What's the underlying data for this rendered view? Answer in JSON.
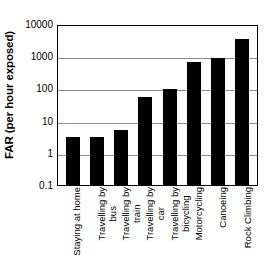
{
  "chart_data": {
    "type": "bar",
    "title": "",
    "xlabel": "",
    "ylabel": "FAR (per hour exposed)",
    "yscale": "log",
    "ylim": [
      0.1,
      10000
    ],
    "yticks": [
      "10000",
      "1000",
      "100",
      "10",
      "1",
      "0.1"
    ],
    "ytick_values": [
      10000,
      1000,
      100,
      10,
      1,
      0.1
    ],
    "grid": true,
    "legend": false,
    "categories": [
      "Staying at home",
      "Travelling by bus",
      "Travelling by train",
      "Travelling by car",
      "Travelling by bicycling",
      "Motorcycling",
      "Canoeing",
      "Rock Climbing"
    ],
    "category_lines": [
      {
        "line1": "Staying at home",
        "line2": ""
      },
      {
        "line1": "Travelling by",
        "line2": "bus"
      },
      {
        "line1": "Travelling by",
        "line2": "train"
      },
      {
        "line1": "Travelling by",
        "line2": "car"
      },
      {
        "line1": "Travelling by",
        "line2": "bicycling"
      },
      {
        "line1": "Motorcycling",
        "line2": ""
      },
      {
        "line1": "Canoeing",
        "line2": ""
      },
      {
        "line1": "Rock Climbing",
        "line2": ""
      }
    ],
    "values": [
      3,
      3,
      5,
      55,
      95,
      640,
      900,
      3500
    ],
    "bar_color": "#000000",
    "grid_color": "#8c8c8c",
    "axis_color": "#000000",
    "background_color": "#ffffff"
  }
}
